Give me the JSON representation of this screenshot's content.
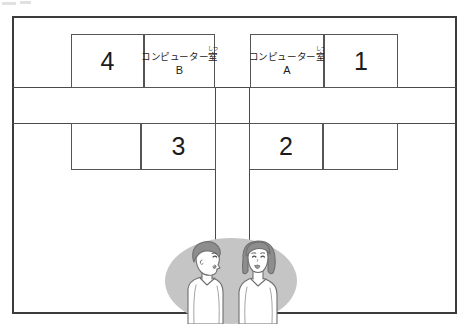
{
  "diagram": {
    "type": "school-floor-plan",
    "title": "",
    "colors": {
      "line": "#4a4a4a",
      "outer_frame": "#3c3c3c",
      "room_fill": "#ffffff",
      "背景_oval": "#c5c5c5",
      "hair": "#8d8d8d",
      "skin_outline": "#6e6e6e",
      "clothes": "#ffffff"
    },
    "rooms": [
      {
        "id": "room-4",
        "label": "4",
        "kind": "numbered",
        "row": "top",
        "side": "left"
      },
      {
        "id": "room-computer-b",
        "label_ruby_base": "コンピューター室",
        "ruby_text": "しつ",
        "ruby_over": "室",
        "sub_label": "B",
        "kind": "named",
        "row": "top",
        "side": "left"
      },
      {
        "id": "room-computer-a",
        "label_ruby_base": "コンピューター室",
        "ruby_text": "しつ",
        "ruby_over": "室",
        "sub_label": "A",
        "kind": "named",
        "row": "top",
        "side": "right"
      },
      {
        "id": "room-1",
        "label": "1",
        "kind": "numbered",
        "row": "top",
        "side": "right"
      },
      {
        "id": "room-blank-left",
        "label": "",
        "kind": "blank",
        "row": "bottom",
        "side": "left"
      },
      {
        "id": "room-3",
        "label": "3",
        "kind": "numbered",
        "row": "bottom",
        "side": "left"
      },
      {
        "id": "room-2",
        "label": "2",
        "kind": "numbered",
        "row": "bottom",
        "side": "right"
      },
      {
        "id": "room-blank-right",
        "label": "",
        "kind": "blank",
        "row": "bottom",
        "side": "right"
      }
    ],
    "people": [
      {
        "id": "boy",
        "description": "boy facing right",
        "facing": "right"
      },
      {
        "id": "girl",
        "description": "girl facing left",
        "facing": "left"
      }
    ]
  }
}
